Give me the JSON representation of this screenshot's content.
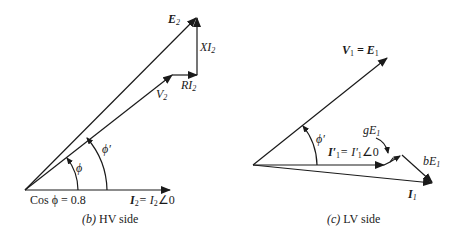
{
  "hv_panel": {
    "caption_letter": "(b)",
    "caption_text": "HV side",
    "labels": {
      "E2": "E",
      "E2_sub": "2",
      "XI2": "XI",
      "XI2_sub": "2",
      "RI2": "RI",
      "RI2_sub": "2",
      "V2": "V",
      "V2_sub": "2",
      "phi": "ϕ",
      "phi_prime": "ϕ′",
      "cos_phi": "Cos ϕ = 0.8",
      "I2_eq": "I",
      "I2_sub": "2",
      "I2_rhs": "= I",
      "I2_rhs_sub": "2",
      "I2_angle": "∠0"
    }
  },
  "lv_panel": {
    "caption_letter": "(c)",
    "caption_text": "LV side",
    "labels": {
      "V1": "V",
      "V1_sub": "1",
      "E1_eq": "= E",
      "E1_sub": "1",
      "phi_prime": "ϕ′",
      "gE1": "gE",
      "gE1_sub": "1",
      "bE1": "bE",
      "bE1_sub": "1",
      "I1p": "I′",
      "I1p_sub": "1",
      "I1p_rhs": "= I′",
      "I1p_rhs_sub": "1",
      "I1p_angle": "∠0",
      "I1": "I",
      "I1_sub": "1"
    }
  },
  "colors": {
    "ink": "#1a1a1a",
    "background": "#ffffff"
  }
}
